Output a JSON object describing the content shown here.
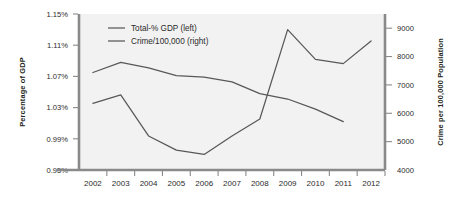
{
  "chart_data": {
    "type": "line",
    "title": "",
    "subtitle": "",
    "xlabel": "",
    "ylabel": "Percentage of GDP",
    "y2label": "Crime per 100,000 Population",
    "grid": false,
    "legend_position": "top-left inside plot",
    "categories": [
      "2002",
      "2003",
      "2004",
      "2005",
      "2006",
      "2007",
      "2008",
      "2009",
      "2010",
      "2011",
      "2012"
    ],
    "x": [
      2002,
      2003,
      2004,
      2005,
      2006,
      2007,
      2008,
      2009,
      2010,
      2011,
      2012
    ],
    "ylim": [
      0.95,
      1.15
    ],
    "yticks": [
      0.95,
      0.99,
      1.03,
      1.07,
      1.11,
      1.15
    ],
    "ytick_labels": [
      "0.95%",
      "0.99%",
      "1.03%",
      "1.07%",
      "1.11%",
      "1.15%"
    ],
    "y2lim": [
      4000,
      9500
    ],
    "y2ticks": [
      4000,
      5000,
      6000,
      7000,
      8000,
      9000
    ],
    "y2tick_labels": [
      "4000",
      "5000",
      "6000",
      "7000",
      "8000",
      "9000"
    ],
    "series": [
      {
        "name": "Total-% GDP (left)",
        "axis": "left",
        "color": "#58585a",
        "x": [
          2002,
          2003,
          2004,
          2005,
          2006,
          2007,
          2008,
          2009,
          2010,
          2011
        ],
        "values": [
          1.075,
          1.088,
          1.081,
          1.071,
          1.069,
          1.063,
          1.048,
          1.041,
          1.028,
          1.012
        ]
      },
      {
        "name": "Crime/100,000 (right)",
        "axis": "right",
        "color": "#58585a",
        "x": [
          2002,
          2003,
          2004,
          2005,
          2006,
          2007,
          2008,
          2009,
          2010,
          2011,
          2012
        ],
        "values": [
          6350,
          6650,
          5200,
          4700,
          4550,
          5200,
          5800,
          8950,
          7900,
          7750,
          8550
        ]
      }
    ]
  },
  "legend": {
    "items": [
      {
        "label": "Total-% GDP (left)"
      },
      {
        "label": "Crime/100,000 (right)"
      }
    ]
  },
  "axes": {
    "left_title": "Percentage of GDP",
    "right_title": "Crime per 100,000 Population"
  },
  "colors": {
    "line": "#58585a",
    "plot_background": "#f2f2f2",
    "spine": "#8a8a8a",
    "text": "#2b2b2b"
  }
}
